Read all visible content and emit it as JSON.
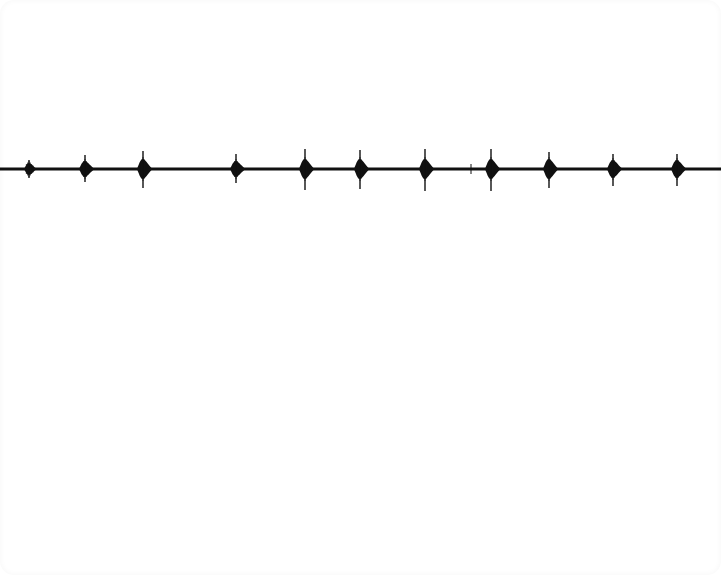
{
  "image": {
    "width": 721,
    "height": 575,
    "background": "#ffffff",
    "trace_color": "#111111"
  },
  "waveform": {
    "baseline_y": 169,
    "baseline_thickness": 3,
    "x_start": 0,
    "x_end": 721,
    "bursts": [
      {
        "x": 29,
        "half_width": 5,
        "body_half_height": 6,
        "spike_up": 9,
        "spike_down": 9
      },
      {
        "x": 85,
        "half_width": 6,
        "body_half_height": 8,
        "spike_up": 14,
        "spike_down": 13
      },
      {
        "x": 143,
        "half_width": 6,
        "body_half_height": 10,
        "spike_up": 18,
        "spike_down": 19
      },
      {
        "x": 236,
        "half_width": 6,
        "body_half_height": 8,
        "spike_up": 15,
        "spike_down": 14
      },
      {
        "x": 305,
        "half_width": 6,
        "body_half_height": 10,
        "spike_up": 20,
        "spike_down": 21
      },
      {
        "x": 360,
        "half_width": 6,
        "body_half_height": 10,
        "spike_up": 19,
        "spike_down": 20
      },
      {
        "x": 425,
        "half_width": 6,
        "body_half_height": 10,
        "spike_up": 20,
        "spike_down": 22
      },
      {
        "x": 491,
        "half_width": 6,
        "body_half_height": 10,
        "spike_up": 20,
        "spike_down": 22
      },
      {
        "x": 549,
        "half_width": 6,
        "body_half_height": 10,
        "spike_up": 17,
        "spike_down": 19
      },
      {
        "x": 613,
        "half_width": 6,
        "body_half_height": 9,
        "spike_up": 15,
        "spike_down": 17
      },
      {
        "x": 677,
        "half_width": 6,
        "body_half_height": 9,
        "spike_up": 15,
        "spike_down": 17
      }
    ],
    "minor_ticks": [
      {
        "x": 471,
        "half_height": 5
      }
    ]
  }
}
